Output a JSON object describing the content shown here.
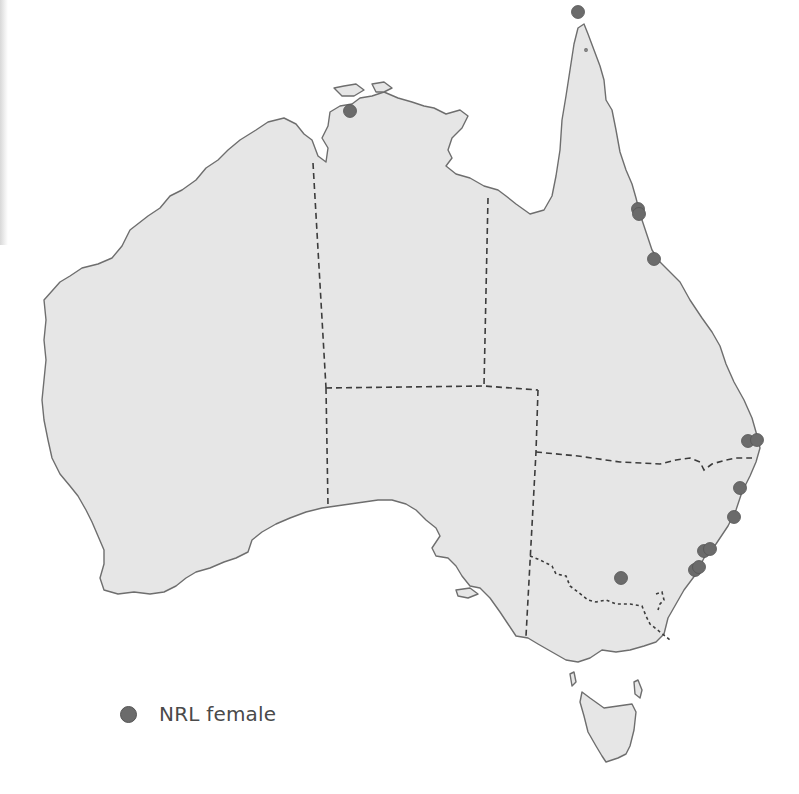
{
  "map": {
    "title": "",
    "region": "Australia",
    "land_color": "#e6e6e6",
    "coast_color": "#6e6e6e",
    "border_color": "#3c3c3c",
    "marker_color": "#6b6b6b",
    "markers": [
      {
        "label": "Darwin",
        "x": 350,
        "y": 111
      },
      {
        "label": "Cape York",
        "x": 578,
        "y": 12
      },
      {
        "label": "Cairns",
        "x": 638,
        "y": 209
      },
      {
        "label": "Cairns",
        "x": 639,
        "y": 214
      },
      {
        "label": "Townsville",
        "x": 654,
        "y": 259
      },
      {
        "label": "Gold Coast",
        "x": 748,
        "y": 441
      },
      {
        "label": "Gold Coast",
        "x": 757,
        "y": 440
      },
      {
        "label": "Coffs Harbour",
        "x": 740,
        "y": 488
      },
      {
        "label": "Newcastle",
        "x": 734,
        "y": 517
      },
      {
        "label": "Sydney",
        "x": 704,
        "y": 551
      },
      {
        "label": "Sydney",
        "x": 710,
        "y": 549
      },
      {
        "label": "Wollongong",
        "x": 695,
        "y": 570
      },
      {
        "label": "Wollongong",
        "x": 699,
        "y": 567
      },
      {
        "label": "Canberra",
        "x": 621,
        "y": 578
      }
    ]
  },
  "legend": {
    "items": [
      {
        "label": "NRL female",
        "color": "#6b6b6b",
        "symbol": "circle"
      }
    ]
  }
}
